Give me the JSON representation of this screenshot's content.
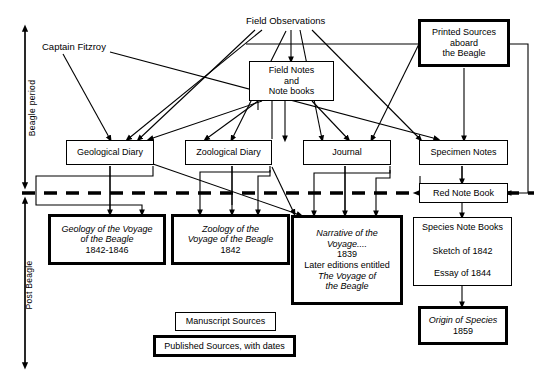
{
  "figure": {
    "type": "flow-diagram"
  },
  "axis": {
    "upper_label": "Beagle period",
    "lower_label": "Post Beagle"
  },
  "labels": {
    "captain_fitzroy": "Captain Fitzroy",
    "field_observations": "Field Observations"
  },
  "nodes": {
    "field_notes": {
      "lines": [
        "Field  Notes",
        "and",
        "Note books"
      ],
      "style": "manuscript"
    },
    "printed_sources": {
      "lines": [
        "Printed  Sources",
        "aboard",
        "the  Beagle"
      ],
      "style": "published"
    },
    "geological_diary": {
      "lines": [
        "Geological  Diary"
      ],
      "style": "manuscript"
    },
    "zoological_diary": {
      "lines": [
        "Zoological  Diary"
      ],
      "style": "manuscript"
    },
    "journal": {
      "lines": [
        "Journal"
      ],
      "style": "manuscript"
    },
    "specimen_notes": {
      "lines": [
        "Specimen  Notes"
      ],
      "style": "manuscript"
    },
    "red_note_book": {
      "lines": [
        "Red  Note  Book"
      ],
      "style": "manuscript"
    },
    "geology_voyage": {
      "lines": [
        "Geology of the Voyage",
        "of the Beagle",
        "1842-1846"
      ],
      "style": "published"
    },
    "zoology_voyage": {
      "lines": [
        "Zoology of the",
        "Voyage of the Beagle",
        "1842"
      ],
      "style": "published"
    },
    "narrative_voyage": {
      "lines": [
        "Narrative of the",
        "Voyage....",
        "1839",
        "Later  editions  entitled",
        "The Voyage of",
        "the Beagle"
      ],
      "style": "published"
    },
    "species_note_books": {
      "lines": [
        "Species  Note  Books",
        "Sketch  of  1842",
        "Essay  of  1844"
      ],
      "style": "manuscript"
    },
    "origin_of_species": {
      "lines": [
        "Origin of Species",
        "1859"
      ],
      "style": "published"
    }
  },
  "legend": {
    "manuscript": "Manuscript Sources",
    "published": "Published Sources, with dates"
  },
  "colors": {
    "ink": "#000000",
    "paper": "#ffffff"
  }
}
